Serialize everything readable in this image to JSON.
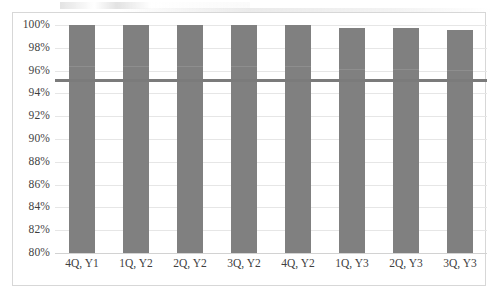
{
  "chart_data": {
    "type": "bar",
    "title": "",
    "subtitle": "",
    "xlabel": "",
    "ylabel": "",
    "categories": [
      "4Q, Y1",
      "1Q, Y2",
      "2Q, Y2",
      "3Q, Y2",
      "4Q, Y2",
      "1Q, Y3",
      "2Q, Y3",
      "3Q, Y3"
    ],
    "series": [
      {
        "name": "Quarterly value",
        "values": [
          100.0,
          100.0,
          100.0,
          100.0,
          100.0,
          99.7,
          99.7,
          99.6
        ]
      }
    ],
    "reference_lines": [
      {
        "name": "target",
        "value": 95.2,
        "orientation": "horizontal",
        "color": "#7b7b7b"
      }
    ],
    "ylim": [
      80,
      100
    ],
    "ytick_labels": [
      "100%",
      "98%",
      "96%",
      "94%",
      "92%",
      "90%",
      "88%",
      "86%",
      "84%",
      "82%",
      "80%"
    ],
    "ytick_values": [
      100,
      98,
      96,
      94,
      92,
      90,
      88,
      86,
      84,
      82,
      80
    ],
    "grid": true,
    "grid_axis": "y",
    "legend": false,
    "legend_position": "none",
    "bar_color": "#808080",
    "plot_background": "#ffffff",
    "frame_color": "#d7d7d7",
    "gridline_color": "#e6e6e6"
  }
}
